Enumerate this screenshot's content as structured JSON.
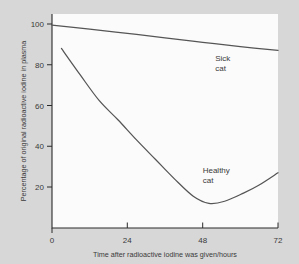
{
  "chart_data": {
    "type": "line",
    "title": "",
    "xlabel": "Time after radioactive iodine was given/hours",
    "ylabel": "Percentage of original radioactive iodine in plasma",
    "xlim": [
      0,
      72
    ],
    "ylim": [
      0,
      104
    ],
    "xticks": [
      0,
      24,
      48,
      72
    ],
    "xtick_labels": [
      "0",
      "24",
      "48",
      "72"
    ],
    "yticks": [
      20,
      40,
      60,
      80,
      100
    ],
    "ytick_labels": [
      "20",
      "40",
      "60",
      "80",
      "100"
    ],
    "grid": false,
    "legend": "inline-annotations",
    "line_color": "#555555",
    "background_color": "#d7d7d7",
    "plot_background_color": "#fbfbfb",
    "series": [
      {
        "name": "Sick cat",
        "label_lines": [
          "Sick",
          "cat"
        ],
        "label_x": 52,
        "label_y": 82,
        "points": [
          [
            0,
            99.5
          ],
          [
            12,
            97.5
          ],
          [
            24,
            95.4
          ],
          [
            36,
            93.2
          ],
          [
            48,
            91.0
          ],
          [
            60,
            88.9
          ],
          [
            72,
            87.0
          ]
        ]
      },
      {
        "name": "Healthy cat",
        "label_lines": [
          "Healthy",
          "cat"
        ],
        "label_x": 48,
        "label_y": 27,
        "points": [
          [
            3,
            88.0
          ],
          [
            9,
            75.0
          ],
          [
            15,
            62.5
          ],
          [
            21,
            53.0
          ],
          [
            27,
            43.0
          ],
          [
            33,
            33.5
          ],
          [
            39,
            24.0
          ],
          [
            45,
            15.5
          ],
          [
            50,
            12.0
          ],
          [
            55,
            13.0
          ],
          [
            61,
            17.0
          ],
          [
            66,
            21.0
          ],
          [
            72,
            27.0
          ]
        ]
      }
    ]
  },
  "axes": {
    "ylabel": "Percentage of original radioactive iodine in plasma",
    "xlabel": "Time after radioactive iodine was given/hours"
  }
}
